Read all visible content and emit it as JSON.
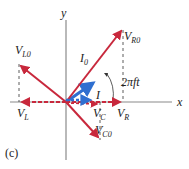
{
  "figure": {
    "panel_label": "(c)",
    "axes": {
      "x_label": "x",
      "y_label": "y"
    },
    "angle_label": "2πft",
    "phasors": [
      {
        "id": "VR0",
        "label": "V",
        "subscript": "R0",
        "color": "#c8283c",
        "style": "solid",
        "direction": "upper-right"
      },
      {
        "id": "I0",
        "label": "I",
        "subscript": "0",
        "color": "#2f6fd0",
        "style": "solid",
        "direction": "upper-right"
      },
      {
        "id": "VL0",
        "label": "V",
        "subscript": "L0",
        "color": "#c8283c",
        "style": "solid",
        "direction": "upper-left"
      },
      {
        "id": "VC0",
        "label": "V",
        "subscript": "C0",
        "color": "#c8283c",
        "style": "solid",
        "direction": "lower-right"
      },
      {
        "id": "I",
        "label": "I",
        "subscript": "",
        "color": "#2f6fd0",
        "style": "dashed",
        "direction": "x-projection"
      },
      {
        "id": "VR",
        "label": "V",
        "subscript": "R",
        "color": "#c8283c",
        "style": "dashed",
        "direction": "x-projection"
      },
      {
        "id": "VC",
        "label": "V",
        "subscript": "C",
        "color": "#c8283c",
        "style": "dashed",
        "direction": "x-projection"
      },
      {
        "id": "VL",
        "label": "V",
        "subscript": "L",
        "color": "#c8283c",
        "style": "dashed",
        "direction": "x-projection"
      }
    ],
    "colors": {
      "axis": "#8a8a8a",
      "red": "#c8283c",
      "blue": "#2f6fd0",
      "guide": "#333333"
    }
  }
}
